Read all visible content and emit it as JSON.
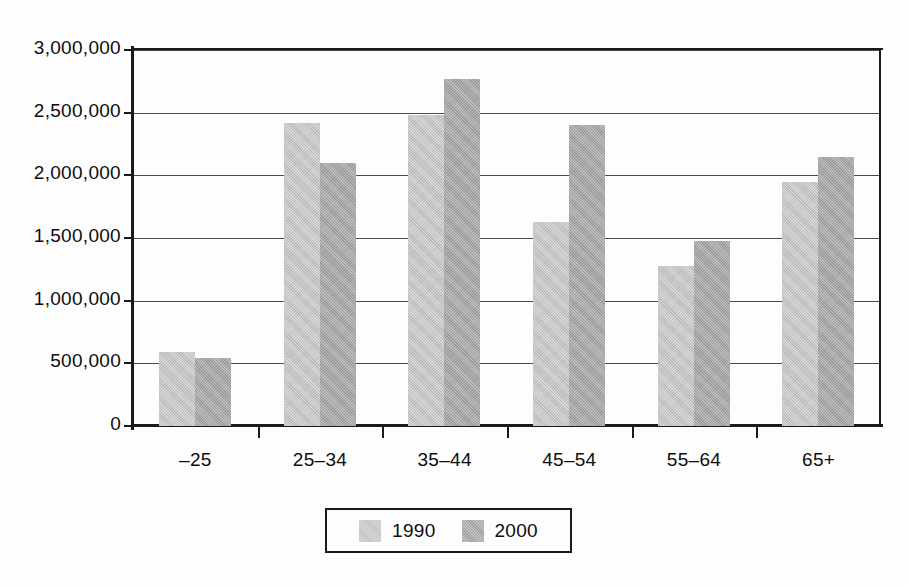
{
  "chart_data": {
    "type": "bar",
    "title": "",
    "subtitle": "",
    "xlabel": "",
    "ylabel": "",
    "categories": [
      "–25",
      "25–34",
      "35–44",
      "45–54",
      "55–64",
      "65+"
    ],
    "series": [
      {
        "name": "1990",
        "color": "#c2c2c2",
        "values": [
          590000,
          2420000,
          2480000,
          1630000,
          1280000,
          1950000
        ]
      },
      {
        "name": "2000",
        "color": "#a2a2a2",
        "values": [
          540000,
          2100000,
          2770000,
          2400000,
          1480000,
          2150000
        ]
      }
    ],
    "ylim": [
      0,
      3000000
    ],
    "ytick_values": [
      0,
      500000,
      1000000,
      1500000,
      2000000,
      2500000,
      3000000
    ],
    "ytick_labels": [
      "0",
      "500,000",
      "1,000,000",
      "1,500,000",
      "2,000,000",
      "2,500,000",
      "3,000,000"
    ],
    "grid": true,
    "legend_position": "bottom-center",
    "legend_entries": [
      "1990",
      "2000"
    ]
  },
  "axes": {
    "y": {
      "labels": [
        "3,000,000",
        "2,500,000",
        "2,000,000",
        "1,500,000",
        "1,000,000",
        "500,000",
        "0"
      ]
    },
    "x": {
      "labels": [
        "–25",
        "25–34",
        "35–44",
        "45–54",
        "55–64",
        "65+"
      ]
    }
  },
  "legend": {
    "items": [
      {
        "label": "1990",
        "color": "#c2c2c2"
      },
      {
        "label": "2000",
        "color": "#a2a2a2"
      }
    ]
  }
}
